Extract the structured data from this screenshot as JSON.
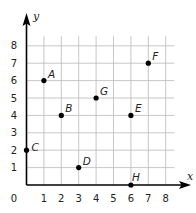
{
  "chart_data": {
    "type": "scatter",
    "title": "",
    "xlabel": "x",
    "ylabel": "y",
    "xlim": [
      0,
      8
    ],
    "ylim": [
      0,
      8
    ],
    "grid": true,
    "origin_label": "0",
    "x_ticks": [
      "1",
      "2",
      "3",
      "4",
      "5",
      "6",
      "7",
      "8"
    ],
    "y_ticks": [
      "1",
      "2",
      "3",
      "4",
      "5",
      "6",
      "7",
      "8"
    ],
    "points": [
      {
        "label": "A",
        "x": 1,
        "y": 6
      },
      {
        "label": "B",
        "x": 2,
        "y": 4
      },
      {
        "label": "C",
        "x": 0,
        "y": 2
      },
      {
        "label": "D",
        "x": 3,
        "y": 1
      },
      {
        "label": "E",
        "x": 6,
        "y": 4
      },
      {
        "label": "F",
        "x": 7,
        "y": 7
      },
      {
        "label": "G",
        "x": 4,
        "y": 5
      },
      {
        "label": "H",
        "x": 6,
        "y": 0
      }
    ]
  }
}
